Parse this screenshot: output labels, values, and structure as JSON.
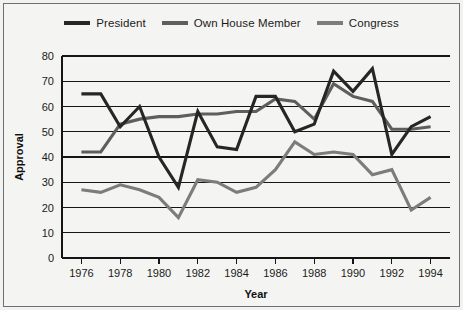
{
  "chart_data": {
    "type": "line",
    "title": "",
    "xlabel": "Year",
    "ylabel": "Approval",
    "xlim": [
      1975,
      1995
    ],
    "ylim": [
      0,
      80
    ],
    "grid": true,
    "legend_position": "top-center",
    "x": [
      1976,
      1977,
      1978,
      1979,
      1980,
      1981,
      1982,
      1983,
      1984,
      1985,
      1986,
      1987,
      1988,
      1989,
      1990,
      1991,
      1992,
      1993,
      1994
    ],
    "xticks": [
      "1976",
      "1978",
      "1980",
      "1982",
      "1984",
      "1986",
      "1988",
      "1990",
      "1992",
      "1994"
    ],
    "xtick_values": [
      1976,
      1978,
      1980,
      1982,
      1984,
      1986,
      1988,
      1990,
      1992,
      1994
    ],
    "yticks": [
      "0",
      "10",
      "20",
      "30",
      "40",
      "50",
      "60",
      "70",
      "80"
    ],
    "ytick_values": [
      0,
      10,
      20,
      30,
      40,
      50,
      60,
      70,
      80
    ],
    "series": [
      {
        "name": "President",
        "color": "#262626",
        "values": [
          65,
          65,
          52,
          60,
          40,
          28,
          58,
          44,
          43,
          64,
          64,
          50,
          53,
          74,
          66,
          75,
          41,
          52,
          56
        ]
      },
      {
        "name": "Own House Member",
        "color": "#5e5e5e",
        "values": [
          42,
          42,
          53,
          55,
          56,
          56,
          57,
          57,
          58,
          58,
          63,
          62,
          55,
          69,
          64,
          62,
          51,
          51,
          52
        ]
      },
      {
        "name": "Congress",
        "color": "#7c7c7c",
        "values": [
          27,
          26,
          29,
          27,
          24,
          16,
          31,
          30,
          26,
          28,
          35,
          46,
          41,
          42,
          41,
          33,
          35,
          19,
          24
        ]
      }
    ]
  },
  "legend": {
    "items": [
      {
        "label": "President",
        "color": "#262626"
      },
      {
        "label": "Own House Member",
        "color": "#5e5e5e"
      },
      {
        "label": "Congress",
        "color": "#7c7c7c"
      }
    ]
  }
}
